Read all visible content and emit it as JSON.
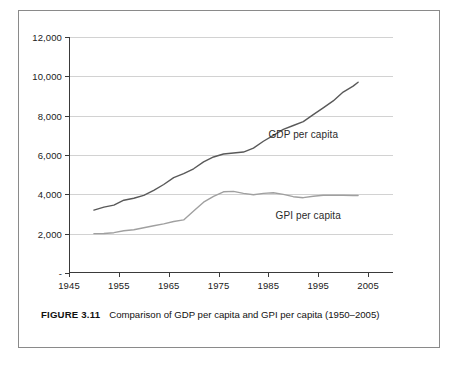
{
  "figure": {
    "caption_label": "FIGURE 3.11",
    "caption_text": "Comparison of GDP per capita and GPI per capita (1950–2005)"
  },
  "chart_data": {
    "type": "line",
    "title": "",
    "xlabel": "",
    "ylabel": "",
    "xlim": [
      1945,
      2010
    ],
    "ylim": [
      0,
      12000
    ],
    "grid": true,
    "legend_position": "inline-annotation",
    "ytick_labels": [
      "-",
      "2,000",
      "4,000",
      "6,000",
      "8,000",
      "10,000",
      "12,000"
    ],
    "ytick_values": [
      0,
      2000,
      4000,
      6000,
      8000,
      10000,
      12000
    ],
    "xtick_labels": [
      "1945",
      "1955",
      "1965",
      "1975",
      "1985",
      "1995",
      "2005"
    ],
    "xtick_values": [
      1945,
      1955,
      1965,
      1975,
      1985,
      1995,
      2005
    ],
    "annotations": [
      {
        "text": "GDP per capita",
        "x": 1992,
        "y": 7050
      },
      {
        "text": "GPI per capita",
        "x": 1993,
        "y": 2950
      }
    ],
    "series": [
      {
        "name": "GDP per capita",
        "color": "#595959",
        "x": [
          1950,
          1952,
          1954,
          1956,
          1958,
          1960,
          1962,
          1964,
          1966,
          1968,
          1970,
          1972,
          1974,
          1976,
          1978,
          1980,
          1982,
          1984,
          1986,
          1988,
          1990,
          1992,
          1994,
          1996,
          1998,
          2000,
          2002,
          2003
        ],
        "values": [
          3200,
          3350,
          3450,
          3700,
          3800,
          3950,
          4200,
          4500,
          4850,
          5050,
          5300,
          5650,
          5900,
          6050,
          6100,
          6150,
          6350,
          6700,
          7000,
          7300,
          7500,
          7700,
          8050,
          8400,
          8750,
          9200,
          9500,
          9700
        ]
      },
      {
        "name": "GPI per capita",
        "color": "#a0a0a0",
        "x": [
          1950,
          1952,
          1954,
          1956,
          1958,
          1960,
          1962,
          1964,
          1966,
          1968,
          1970,
          1972,
          1974,
          1976,
          1978,
          1980,
          1982,
          1984,
          1986,
          1988,
          1990,
          1992,
          1994,
          1996,
          1998,
          2000,
          2002,
          2003
        ],
        "values": [
          2000,
          2010,
          2050,
          2150,
          2200,
          2300,
          2400,
          2500,
          2620,
          2700,
          3150,
          3600,
          3900,
          4130,
          4150,
          4050,
          3980,
          4050,
          4080,
          4000,
          3880,
          3830,
          3900,
          3950,
          3960,
          3950,
          3940,
          3940
        ]
      }
    ]
  }
}
